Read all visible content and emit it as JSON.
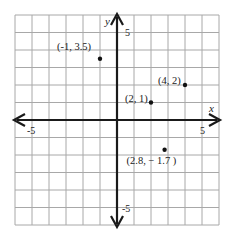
{
  "chart_data": {
    "type": "scatter",
    "title": "",
    "xlabel": "x",
    "ylabel": "y",
    "xlim": [
      -6,
      6
    ],
    "ylim": [
      -6,
      6
    ],
    "grid": true,
    "tick_labels": {
      "x": [
        {
          "value": -5,
          "label": "-5"
        },
        {
          "value": 5,
          "label": "5"
        }
      ],
      "y": [
        {
          "value": 5,
          "label": "5"
        },
        {
          "value": -5,
          "label": "-5"
        }
      ]
    },
    "points": [
      {
        "x": -1,
        "y": 3.5,
        "label": "(-1, 3.5)"
      },
      {
        "x": 2,
        "y": 1,
        "label": "(2, 1)"
      },
      {
        "x": 4,
        "y": 2,
        "label": "(4, 2)"
      },
      {
        "x": 2.8,
        "y": -1.7,
        "label": "(2.8, − 1.7 )"
      }
    ]
  },
  "colors": {
    "grid": "#a8a8a8",
    "axis": "#1a1a1a",
    "point": "#111111",
    "text": "#222222",
    "background": "#ffffff"
  }
}
